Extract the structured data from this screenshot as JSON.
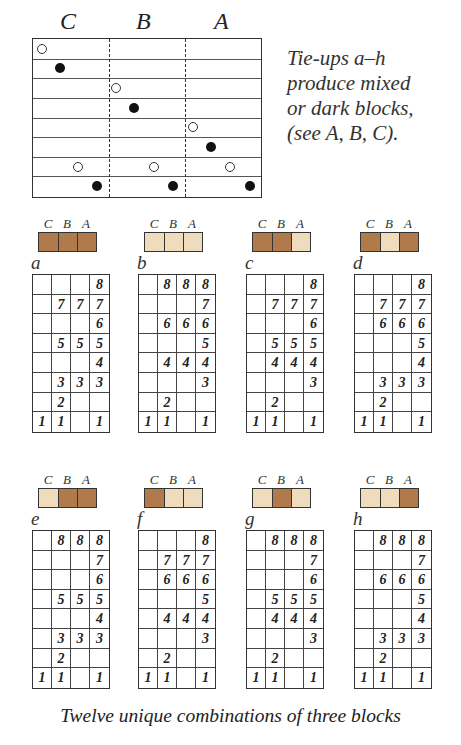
{
  "tieup_diagram": {
    "column_labels": [
      "C",
      "B",
      "A"
    ],
    "rows": 8,
    "dots": [
      {
        "row": 0,
        "x": 0.04,
        "type": "open"
      },
      {
        "row": 1,
        "x": 0.12,
        "type": "filled"
      },
      {
        "row": 2,
        "x": 0.365,
        "type": "open"
      },
      {
        "row": 3,
        "x": 0.445,
        "type": "filled"
      },
      {
        "row": 4,
        "x": 0.705,
        "type": "open"
      },
      {
        "row": 5,
        "x": 0.785,
        "type": "filled"
      },
      {
        "row": 6,
        "x": 0.2,
        "type": "open"
      },
      {
        "row": 6,
        "x": 0.535,
        "type": "open"
      },
      {
        "row": 6,
        "x": 0.87,
        "type": "open"
      },
      {
        "row": 7,
        "x": 0.28,
        "type": "filled"
      },
      {
        "row": 7,
        "x": 0.615,
        "type": "filled"
      },
      {
        "row": 7,
        "x": 0.955,
        "type": "filled"
      }
    ]
  },
  "note": "Tie-ups a–h\nproduce mixed\nor dark blocks,\n(see A, B, C).",
  "colors": {
    "dark": "#b07a4a",
    "light": "#efdcbc",
    "line": "#333333"
  },
  "panels": [
    {
      "id": "a",
      "swatch": [
        "dark",
        "dark",
        "dark"
      ],
      "grid": [
        [
          "",
          "",
          "",
          "8"
        ],
        [
          "",
          "7",
          "7",
          "7"
        ],
        [
          "",
          "",
          "",
          "6"
        ],
        [
          "",
          "5",
          "5",
          "5"
        ],
        [
          "",
          "",
          "",
          "4"
        ],
        [
          "",
          "3",
          "3",
          "3"
        ],
        [
          "",
          "2",
          "",
          ""
        ],
        [
          "1",
          "1",
          "",
          "1"
        ]
      ]
    },
    {
      "id": "b",
      "swatch": [
        "light",
        "light",
        "light"
      ],
      "grid": [
        [
          "",
          "8",
          "8",
          "8"
        ],
        [
          "",
          "",
          "",
          "7"
        ],
        [
          "",
          "6",
          "6",
          "6"
        ],
        [
          "",
          "",
          "",
          "5"
        ],
        [
          "",
          "4",
          "4",
          "4"
        ],
        [
          "",
          "",
          "",
          "3"
        ],
        [
          "",
          "2",
          "",
          ""
        ],
        [
          "1",
          "1",
          "",
          "1"
        ]
      ]
    },
    {
      "id": "c",
      "swatch": [
        "dark",
        "dark",
        "light"
      ],
      "grid": [
        [
          "",
          "",
          "",
          "8"
        ],
        [
          "",
          "7",
          "7",
          "7"
        ],
        [
          "",
          "",
          "",
          "6"
        ],
        [
          "",
          "5",
          "5",
          "5"
        ],
        [
          "",
          "4",
          "4",
          "4"
        ],
        [
          "",
          "",
          "",
          "3"
        ],
        [
          "",
          "2",
          "",
          ""
        ],
        [
          "1",
          "1",
          "",
          "1"
        ]
      ]
    },
    {
      "id": "d",
      "swatch": [
        "dark",
        "light",
        "dark"
      ],
      "grid": [
        [
          "",
          "",
          "",
          "8"
        ],
        [
          "",
          "7",
          "7",
          "7"
        ],
        [
          "",
          "6",
          "6",
          "6"
        ],
        [
          "",
          "",
          "",
          "5"
        ],
        [
          "",
          "",
          "",
          "4"
        ],
        [
          "",
          "3",
          "3",
          "3"
        ],
        [
          "",
          "2",
          "",
          ""
        ],
        [
          "1",
          "1",
          "",
          "1"
        ]
      ]
    },
    {
      "id": "e",
      "swatch": [
        "light",
        "dark",
        "dark"
      ],
      "grid": [
        [
          "",
          "8",
          "8",
          "8"
        ],
        [
          "",
          "",
          "",
          "7"
        ],
        [
          "",
          "",
          "",
          "6"
        ],
        [
          "",
          "5",
          "5",
          "5"
        ],
        [
          "",
          "",
          "",
          "4"
        ],
        [
          "",
          "3",
          "3",
          "3"
        ],
        [
          "",
          "2",
          "",
          ""
        ],
        [
          "1",
          "1",
          "",
          "1"
        ]
      ]
    },
    {
      "id": "f",
      "swatch": [
        "dark",
        "light",
        "light"
      ],
      "grid": [
        [
          "",
          "",
          "",
          "8"
        ],
        [
          "",
          "7",
          "7",
          "7"
        ],
        [
          "",
          "6",
          "6",
          "6"
        ],
        [
          "",
          "",
          "",
          "5"
        ],
        [
          "",
          "4",
          "4",
          "4"
        ],
        [
          "",
          "",
          "",
          "3"
        ],
        [
          "",
          "2",
          "",
          ""
        ],
        [
          "1",
          "1",
          "",
          "1"
        ]
      ]
    },
    {
      "id": "g",
      "swatch": [
        "light",
        "dark",
        "light"
      ],
      "grid": [
        [
          "",
          "8",
          "8",
          "8"
        ],
        [
          "",
          "",
          "",
          "7"
        ],
        [
          "",
          "",
          "",
          "6"
        ],
        [
          "",
          "5",
          "5",
          "5"
        ],
        [
          "",
          "4",
          "4",
          "4"
        ],
        [
          "",
          "",
          "",
          "3"
        ],
        [
          "",
          "2",
          "",
          ""
        ],
        [
          "1",
          "1",
          "",
          "1"
        ]
      ]
    },
    {
      "id": "h",
      "swatch": [
        "light",
        "light",
        "dark"
      ],
      "grid": [
        [
          "",
          "8",
          "8",
          "8"
        ],
        [
          "",
          "",
          "",
          "7"
        ],
        [
          "",
          "6",
          "6",
          "6"
        ],
        [
          "",
          "",
          "",
          "5"
        ],
        [
          "",
          "",
          "",
          "4"
        ],
        [
          "",
          "3",
          "3",
          "3"
        ],
        [
          "",
          "2",
          "",
          ""
        ],
        [
          "1",
          "1",
          "",
          "1"
        ]
      ]
    }
  ],
  "swatch_labels": [
    "C",
    "B",
    "A"
  ],
  "caption": "Twelve unique combinations of three blocks"
}
